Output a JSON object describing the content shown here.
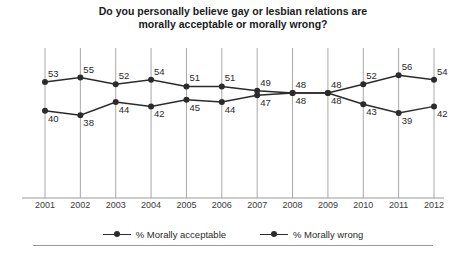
{
  "chart_data": {
    "type": "line",
    "title": "Do you personally believe gay or lesbian relations are morally acceptable or morally wrong?",
    "title_line1": "Do you personally believe gay or lesbian relations are",
    "title_line2": "morally acceptable or morally wrong?",
    "xlabel": "",
    "ylabel": "",
    "ylim": [
      30,
      62
    ],
    "grid": "vertical",
    "legend_position": "bottom-center",
    "categories": [
      "2001",
      "2002",
      "2003",
      "2004",
      "2005",
      "2006",
      "2007",
      "2008",
      "2009",
      "2010",
      "2011",
      "2012"
    ],
    "series": [
      {
        "name": "% Morally acceptable",
        "color": "#2b2b2b",
        "values": [
          40,
          38,
          44,
          42,
          45,
          44,
          47,
          48,
          48,
          52,
          56,
          54
        ]
      },
      {
        "name": "% Morally wrong",
        "color": "#2b2b2b",
        "values": [
          53,
          55,
          52,
          54,
          51,
          51,
          49,
          48,
          48,
          43,
          39,
          42
        ]
      }
    ]
  },
  "legend": {
    "items": [
      {
        "label": "% Morally acceptable"
      },
      {
        "label": "% Morally wrong"
      }
    ]
  }
}
